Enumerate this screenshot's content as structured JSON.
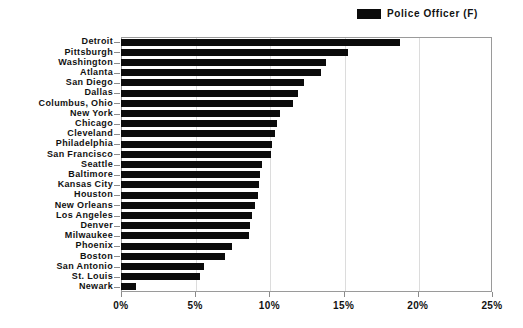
{
  "chart_data": {
    "type": "bar",
    "orientation": "horizontal",
    "title": "",
    "subtitle": "",
    "xlabel": "",
    "ylabel": "",
    "xlim": [
      0,
      25
    ],
    "xticks": [
      0,
      5,
      10,
      15,
      20,
      25
    ],
    "xtick_labels": [
      "0%",
      "5%",
      "10%",
      "15%",
      "20%",
      "25%"
    ],
    "grid": true,
    "grid_axis": "x",
    "legend": {
      "position": "top-right",
      "entries": [
        {
          "label": "Police Officer (F)",
          "color": "#0b0b0b",
          "marker": "filled-rectangle"
        }
      ]
    },
    "series": [
      {
        "name": "Police Officer (F)",
        "color": "#0b0b0b",
        "values": [
          18.8,
          15.3,
          13.8,
          13.5,
          12.3,
          11.9,
          11.6,
          10.7,
          10.5,
          10.4,
          10.2,
          10.1,
          9.5,
          9.4,
          9.3,
          9.2,
          9.0,
          8.8,
          8.7,
          8.6,
          7.5,
          7.0,
          5.6,
          5.3,
          1.0
        ]
      }
    ],
    "categories": [
      "Detroit",
      "Pittsburgh",
      "Washington",
      "Atlanta",
      "San Diego",
      "Dallas",
      "Columbus, Ohio",
      "New York",
      "Chicago",
      "Cleveland",
      "Philadelphia",
      "San Francisco",
      "Seattle",
      "Baltimore",
      "Kansas City",
      "Houston",
      "New Orleans",
      "Los Angeles",
      "Denver",
      "Milwaukee",
      "Phoenix",
      "Boston",
      "San Antonio",
      "St. Louis",
      "Newark"
    ]
  },
  "colors": {
    "bar": "#0b0b0b",
    "frame": "#9a9a9a",
    "grid": "#dcdcdc",
    "text": "#111111",
    "background": "#ffffff"
  }
}
